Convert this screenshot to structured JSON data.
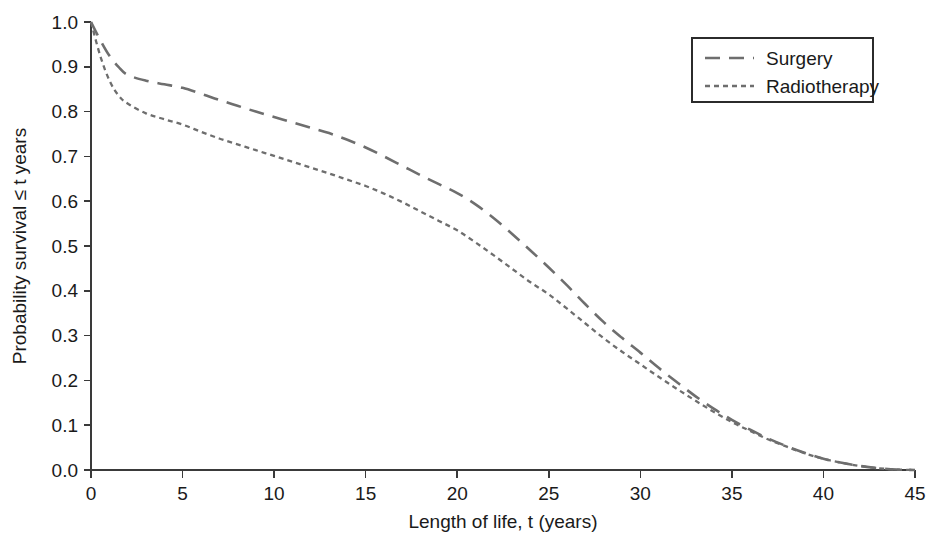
{
  "chart_data": {
    "type": "line",
    "title": "",
    "xlabel": "Length of life, t (years)",
    "ylabel": "Probability survival ≤ t years",
    "xlim": [
      0,
      45
    ],
    "ylim": [
      0,
      1.0
    ],
    "xticks": [
      0,
      5,
      10,
      15,
      20,
      25,
      30,
      35,
      40,
      45
    ],
    "xtick_labels": [
      "0",
      "5",
      "10",
      "15",
      "20",
      "25",
      "30",
      "35",
      "40",
      "45"
    ],
    "yticks": [
      0.0,
      0.1,
      0.2,
      0.3,
      0.4,
      0.5,
      0.6,
      0.7,
      0.8,
      0.9,
      1.0
    ],
    "ytick_labels": [
      "0.0",
      "0.1",
      "0.2",
      "0.3",
      "0.4",
      "0.5",
      "0.6",
      "0.7",
      "0.8",
      "0.9",
      "1.0"
    ],
    "grid": false,
    "legend_position": "top-right",
    "line_color": "#6e6e6e",
    "x": [
      0,
      0.5,
      1,
      1.5,
      2,
      3,
      4,
      5,
      6,
      7,
      8,
      9,
      10,
      11,
      12,
      13,
      14,
      15,
      16,
      17,
      18,
      19,
      20,
      21,
      22,
      23,
      24,
      25,
      26,
      27,
      28,
      29,
      30,
      31,
      32,
      33,
      34,
      35,
      36,
      37,
      38,
      39,
      40,
      41,
      42,
      43,
      44,
      45
    ],
    "series": [
      {
        "name": "Surgery",
        "dash": "long-dash",
        "values": [
          1.0,
          0.96,
          0.925,
          0.9,
          0.882,
          0.869,
          0.861,
          0.853,
          0.84,
          0.826,
          0.813,
          0.8,
          0.788,
          0.776,
          0.764,
          0.752,
          0.737,
          0.72,
          0.7,
          0.679,
          0.658,
          0.638,
          0.618,
          0.593,
          0.562,
          0.527,
          0.49,
          0.452,
          0.412,
          0.37,
          0.33,
          0.295,
          0.262,
          0.228,
          0.196,
          0.165,
          0.137,
          0.112,
          0.09,
          0.07,
          0.053,
          0.038,
          0.025,
          0.016,
          0.009,
          0.004,
          0.001,
          0.0
        ]
      },
      {
        "name": "Radiotherapy",
        "dash": "short-dash",
        "values": [
          1.0,
          0.925,
          0.87,
          0.836,
          0.818,
          0.796,
          0.783,
          0.771,
          0.755,
          0.74,
          0.727,
          0.714,
          0.701,
          0.688,
          0.675,
          0.662,
          0.648,
          0.634,
          0.617,
          0.598,
          0.577,
          0.556,
          0.535,
          0.508,
          0.479,
          0.449,
          0.419,
          0.392,
          0.36,
          0.327,
          0.294,
          0.264,
          0.236,
          0.208,
          0.181,
          0.155,
          0.13,
          0.107,
          0.087,
          0.068,
          0.052,
          0.037,
          0.025,
          0.016,
          0.009,
          0.004,
          0.001,
          0.0
        ]
      }
    ]
  },
  "legend": {
    "items": [
      {
        "label": "Surgery"
      },
      {
        "label": "Radiotherapy"
      }
    ]
  }
}
